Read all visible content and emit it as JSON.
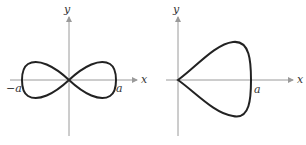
{
  "figures": [
    {
      "name": "lemniscate",
      "axis_labels": {
        "x": "x",
        "y": "y"
      },
      "point_labels": {
        "left": "−a",
        "right": "a"
      }
    },
    {
      "name": "teardrop-loop",
      "axis_labels": {
        "x": "x",
        "y": "y"
      },
      "point_labels": {
        "right": "a"
      }
    }
  ],
  "colors": {
    "curve": "#222222",
    "axis": "#9a9a9a",
    "background": "#ffffff"
  }
}
